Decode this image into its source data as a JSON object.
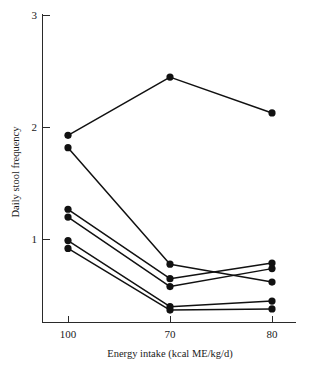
{
  "chart_data": {
    "type": "line",
    "title": "",
    "xlabel": "Energy intake (kcal ME/kg/d)",
    "ylabel": "Daily stool frequency",
    "categories": [
      "100",
      "70",
      "80"
    ],
    "x_tick_labels": [
      "100",
      "70",
      "80"
    ],
    "y_tick_labels": [
      "1",
      "2",
      "3"
    ],
    "ylim": [
      0.28,
      3.0
    ],
    "yticks": [
      1,
      2,
      3
    ],
    "grid": false,
    "legend": false,
    "series": [
      {
        "name": "subject-1",
        "values": [
          1.93,
          2.45,
          2.13
        ]
      },
      {
        "name": "subject-2",
        "values": [
          1.82,
          0.78,
          0.62
        ]
      },
      {
        "name": "subject-3",
        "values": [
          1.27,
          0.65,
          0.79
        ]
      },
      {
        "name": "subject-4",
        "values": [
          1.2,
          0.58,
          0.74
        ]
      },
      {
        "name": "subject-5",
        "values": [
          0.99,
          0.4,
          0.45
        ]
      },
      {
        "name": "subject-6",
        "values": [
          0.92,
          0.37,
          0.38
        ]
      }
    ]
  },
  "axes": {
    "x_title": "Energy intake (kcal ME/kg/d)",
    "y_title": "Daily stool frequency",
    "x_tick_1": "100",
    "x_tick_2": "70",
    "x_tick_3": "80",
    "y_tick_1": "1",
    "y_tick_2": "2",
    "y_tick_3": "3"
  },
  "colors": {
    "marker": "#111111",
    "line": "#111111",
    "axis": "#2a2a2a",
    "background": "#ffffff"
  }
}
